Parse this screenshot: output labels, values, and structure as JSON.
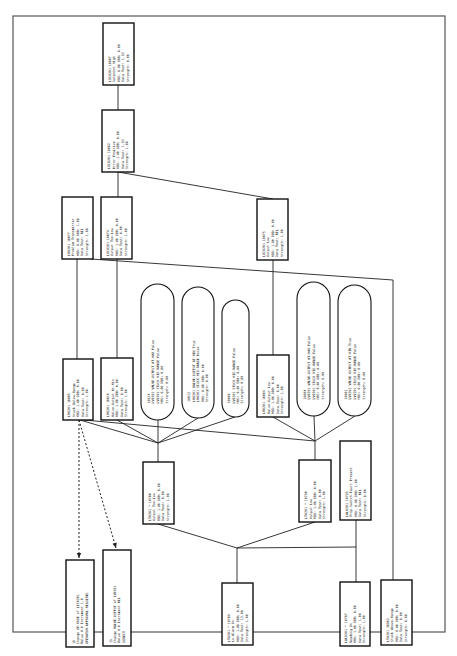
{
  "diagram": {
    "title": "",
    "nodes": [
      {
        "id": "n10887",
        "shape": "rect",
        "x": 103,
        "y": 23,
        "w": 31,
        "h": 62,
        "lines": [
          "LIC0201  10887",
          "Setpoint High",
          "MBD: 0.00 DBB: 0.00",
          "Data Test: 1.93",
          "Strength: 0.00"
        ]
      },
      {
        "id": "n10882",
        "shape": "rect",
        "x": 102,
        "y": 110,
        "w": 32,
        "h": 62,
        "lines": [
          "LIC0201  10882",
          "Error Positive",
          "MBD: 1.00 DBB: 0.00",
          "Data Test: 1.93",
          "Strength: 1.00"
        ]
      },
      {
        "id": "n10877",
        "shape": "rect",
        "x": 62,
        "y": 197,
        "w": 31,
        "h": 62,
        "lines": [
          "LV0201  10877",
          "Problem Transmitter",
          "MBD: 0.00 DBB: 1.00",
          "Data Test: NIL",
          "Strength: 1.00"
        ]
      },
      {
        "id": "n10874",
        "shape": "rect",
        "x": 101,
        "y": 197,
        "w": 31,
        "h": 62,
        "lines": [
          "LIC0201  10874",
          "Output Too-Low",
          "MBD: 1.00 DBB: 0.00",
          "Data Test: 0.00",
          "Strength: 1.00"
        ]
      },
      {
        "id": "n10875",
        "shape": "rect",
        "x": 257,
        "y": 199,
        "w": 31,
        "h": 61,
        "lines": [
          "LIC0201  10875",
          "Output Low",
          "MBD: 1.00 DBB: 0.00",
          "Data Test: NIL",
          "Strength: 1.00"
        ]
      },
      {
        "id": "n10805",
        "shape": "rect",
        "x": 63,
        "y": 359,
        "w": 30,
        "h": 61,
        "lines": [
          "LV0201  10805",
          "Stuck Below-Range",
          "MBD: 1.00 DBB: 0.00",
          "Data Test: 0.00",
          "Strength: 1.00"
        ]
      },
      {
        "id": "n10816",
        "shape": "rect",
        "x": 101,
        "y": 358,
        "w": 32,
        "h": 62,
        "lines": [
          "LV0201  10816",
          "Valve-Output At-Min",
          "MBD: 1.00 DBB: 0.00",
          "Data Test: 0.00",
          "Strength: 1.00"
        ]
      },
      {
        "id": "c10814",
        "shape": "capsule",
        "x": 141,
        "y": 284,
        "w": 33,
        "h": 136,
        "lines": [
          "10814",
          "LV0201 VALVE-OUTPUT AT-MAX False",
          "LV0201 STUCK MID-RANGE False",
          "MBD: 0.00  DBB: 0.00",
          "Strength: 0.00"
        ]
      },
      {
        "id": "c10812",
        "shape": "capsule",
        "x": 182,
        "y": 287,
        "w": 32,
        "h": 131,
        "lines": [
          "10812",
          "LV0201 VALVE-OUTPUT AT-MIN True",
          "LV0201 STUCK MID-RANGE False",
          "MBD: 0.00  DBB: 0.00",
          "Strength: 0.00"
        ]
      },
      {
        "id": "c10808",
        "shape": "capsule",
        "x": 222,
        "y": 300,
        "w": 27,
        "h": 117,
        "lines": [
          "10808",
          "LV0201 STUCK MID-RANGE False",
          "MBD: 0.00  DBB: 0.00",
          "Strength: 0.00"
        ]
      },
      {
        "id": "n10804v",
        "shape": "rect",
        "x": 257,
        "y": 355,
        "w": 32,
        "h": 62,
        "lines": [
          "LV0201  10804",
          "Valve-Output Low",
          "MBD: 1.00 DBB: 0.00",
          "Data Test: 0.00",
          "Strength: 1.00"
        ]
      },
      {
        "id": "c10804",
        "shape": "capsule",
        "x": 297,
        "y": 282,
        "w": 33,
        "h": 134,
        "lines": [
          "10804",
          "LV0201 VALVE-OUTPUT AT-MAX False",
          "LV0201 STUCK MID-RANGE False",
          "MBD: 0.00  DBB: 0.00",
          "Strength: 0.00"
        ]
      },
      {
        "id": "c10801",
        "shape": "capsule",
        "x": 338,
        "y": 285,
        "w": 33,
        "h": 131,
        "lines": [
          "10801",
          "LV0201 VALVE-OUTPUT AT-MIN True",
          "LV0201 STUCK MID-RANGE False",
          "MBD: 0.00  DBB: 0.00",
          "Strength: 0.00"
        ]
      },
      {
        "id": "n10788",
        "shape": "rect",
        "x": 143,
        "y": 462,
        "w": 31,
        "h": 62,
        "lines": [
          "LT0201 * 10788",
          "Output Too-Low",
          "MBD: 1.00 DBB: 0.00",
          "Data Test: 0.00",
          "Strength: 1.00"
        ]
      },
      {
        "id": "n10790",
        "shape": "rect",
        "x": 299,
        "y": 460,
        "w": 32,
        "h": 62,
        "lines": [
          "LT0201 * 10790",
          "Output Low",
          "MBD: 1.00 DBB: 0.00",
          "Data Test: 0.00",
          "Strength: 1.00"
        ]
      },
      {
        "id": "n10795",
        "shape": "rect",
        "x": 340,
        "y": 441,
        "w": 31,
        "h": 79,
        "lines": [
          "LAL0201  10795",
          "Trip-Switch-Fault Present",
          "MBD: 0.00 DBB: 1.00",
          "Data Test: NIL",
          "Strength: 0.00"
        ]
      },
      {
        "id": "a16",
        "shape": "rect",
        "x": 66,
        "y": 560,
        "w": 28,
        "h": 87,
        "lines": [
          "16",
          "Change OP-MODE of LIC0201",
          "Value 0.0 Increment 1.0",
          "OPERATOR-APPROVAL-REQUIRED"
        ]
      },
      {
        "id": "a15",
        "shape": "rect",
        "x": 103,
        "y": 550,
        "w": 28,
        "h": 96,
        "lines": [
          "15",
          "Change VALVE-OUTPUT of LV0201",
          "Value 0.0 Increment NIL",
          "DIRECT"
        ]
      },
      {
        "id": "n10789",
        "shape": "rect",
        "x": 222,
        "y": 583,
        "w": 31,
        "h": 62,
        "lines": [
          "LT0201 * 10789",
          "Lo-Alarm On",
          "MBD: 1.00 DBB: 0.00",
          "Data Test: 13.00",
          "Strength: 1.00"
        ]
      },
      {
        "id": "n10787",
        "shape": "rect",
        "x": 340,
        "y": 582,
        "w": 30,
        "h": 64,
        "lines": [
          "LAL0201 * 10787",
          "Reading On",
          "MBD: 1.00 DBB: 0.00",
          "Data Test: 1.00",
          "Strength: 1.00"
        ]
      },
      {
        "id": "n38962",
        "shape": "rect",
        "x": 381,
        "y": 580,
        "w": 31,
        "h": 65,
        "lines": [
          "LT0201  38962",
          "Stuck Above-Range",
          "MBD: 0.00 DBB: 0.00",
          "Data Test: 0.00",
          "Strength: 0.00"
        ]
      }
    ],
    "edges": [
      {
        "points": [
          [
            118,
            85
          ],
          [
            118,
            110
          ]
        ],
        "style": "solid"
      },
      {
        "points": [
          [
            118,
            172
          ],
          [
            118,
            197
          ]
        ],
        "style": "solid"
      },
      {
        "points": [
          [
            118,
            172
          ],
          [
            273,
            199
          ]
        ],
        "style": "solid"
      },
      {
        "points": [
          [
            77,
            259
          ],
          [
            77,
            359
          ]
        ],
        "style": "solid"
      },
      {
        "points": [
          [
            117,
            259
          ],
          [
            117,
            358
          ]
        ],
        "style": "solid"
      },
      {
        "points": [
          [
            273,
            260
          ],
          [
            273,
            355
          ]
        ],
        "style": "solid"
      },
      {
        "points": [
          [
            91,
            259
          ],
          [
            393,
            280
          ],
          [
            393,
            580
          ]
        ],
        "style": "solid"
      },
      {
        "points": [
          [
            80,
            420
          ],
          [
            158,
            443
          ]
        ],
        "style": "solid"
      },
      {
        "points": [
          [
            84,
            420
          ],
          [
            315,
            441
          ]
        ],
        "style": "solid"
      },
      {
        "points": [
          [
            117,
            420
          ],
          [
            158,
            443
          ]
        ],
        "style": "solid"
      },
      {
        "points": [
          [
            158,
            420
          ],
          [
            158,
            443
          ]
        ],
        "style": "solid"
      },
      {
        "points": [
          [
            198,
            418
          ],
          [
            158,
            443
          ]
        ],
        "style": "solid"
      },
      {
        "points": [
          [
            235,
            417
          ],
          [
            158,
            443
          ]
        ],
        "style": "solid"
      },
      {
        "points": [
          [
            273,
            417
          ],
          [
            315,
            441
          ]
        ],
        "style": "solid"
      },
      {
        "points": [
          [
            314,
            416
          ],
          [
            315,
            441
          ]
        ],
        "style": "solid"
      },
      {
        "points": [
          [
            355,
            416
          ],
          [
            315,
            441
          ]
        ],
        "style": "solid"
      },
      {
        "points": [
          [
            158,
            443
          ],
          [
            158,
            462
          ]
        ],
        "style": "solid"
      },
      {
        "points": [
          [
            315,
            441
          ],
          [
            315,
            460
          ]
        ],
        "style": "solid"
      },
      {
        "points": [
          [
            158,
            524
          ],
          [
            237,
            548
          ]
        ],
        "style": "solid"
      },
      {
        "points": [
          [
            315,
            522
          ],
          [
            237,
            548
          ]
        ],
        "style": "solid"
      },
      {
        "points": [
          [
            237,
            548
          ],
          [
            356,
            547
          ]
        ],
        "style": "solid"
      },
      {
        "points": [
          [
            237,
            548
          ],
          [
            237,
            583
          ]
        ],
        "style": "solid"
      },
      {
        "points": [
          [
            356,
            520
          ],
          [
            356,
            582
          ]
        ],
        "style": "solid"
      },
      {
        "points": [
          [
            79,
            420
          ],
          [
            79,
            558
          ]
        ],
        "style": "dashed",
        "arrow": true
      },
      {
        "points": [
          [
            79,
            420
          ],
          [
            116,
            548
          ]
        ],
        "style": "dashed",
        "arrow": true
      }
    ]
  }
}
